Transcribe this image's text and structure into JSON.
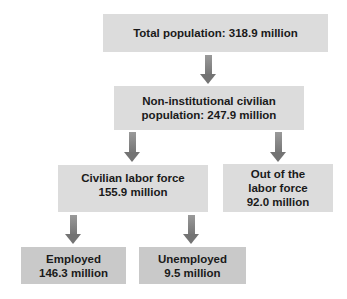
{
  "diagram": {
    "total": {
      "line1": "Total population: 318.9 million"
    },
    "noninst": {
      "line1": "Non-institutional civilian",
      "line2": "population: 247.9 million"
    },
    "labor_force": {
      "line1": "Civilian labor force",
      "line2": "155.9 million"
    },
    "out_of_labor": {
      "line1": "Out of the",
      "line2": "labor force",
      "line3": "92.0 million"
    },
    "employed": {
      "line1": "Employed",
      "line2": "146.3 million"
    },
    "unemployed": {
      "line1": "Unemployed",
      "line2": "9.5 million"
    }
  },
  "colors": {
    "upper_box": "#dcdcdc",
    "lower_box": "#c9c9c9",
    "arrow": "#777777"
  }
}
